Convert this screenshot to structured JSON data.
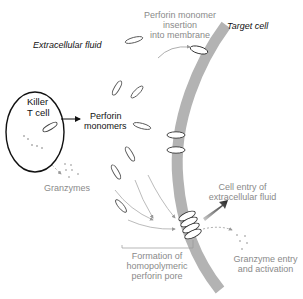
{
  "labels": {
    "extracellular_fluid": "Extracellular fluid",
    "target_cell": "Target cell",
    "perforin_insertion_line1": "Perforin monomer",
    "perforin_insertion_line2": "insertion",
    "perforin_insertion_line3": "into membrane",
    "killer_line1": "Killer",
    "killer_line2": "T cell",
    "perforin_monomers_line1": "Perforin",
    "perforin_monomers_line2": "monomers",
    "granzymes": "Granzymes",
    "cell_entry_line1": "Cell entry of",
    "cell_entry_line2": "extracellular fluid",
    "formation_line1": "Formation of",
    "formation_line2": "homopolymeric",
    "formation_line3": "perforin pore",
    "granzyme_entry_line1": "Granzyme entry",
    "granzyme_entry_line2": "and activation"
  },
  "colors": {
    "membrane": "#b3b3b3",
    "outline": "#111111",
    "gray_text": "#8a8a8a",
    "arrow_gray": "#a0a0a0"
  }
}
